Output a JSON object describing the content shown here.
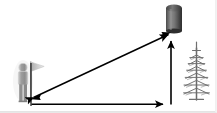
{
  "figure": {
    "title": "Surveying sight-line diagram",
    "background_color": "#ffffff",
    "width": 217,
    "height": 113
  },
  "palette": {
    "line_color": "#000000",
    "person_fill": "#9a9a9a",
    "person_outline": "#cfcfcf",
    "flag_fill": "#c9c9c9",
    "pole_color": "#b4b4b4",
    "cylinder_dark": "#3a3a3a",
    "cylinder_mid": "#6e6e6e",
    "cylinder_light": "#8c8c8c",
    "tree_color": "#6b6b6b",
    "border_color": "#e8e8e8"
  },
  "objects": {
    "observer": {
      "name": "person",
      "label": "",
      "x": 17,
      "y": 62,
      "width": 14,
      "height": 40
    },
    "flag": {
      "name": "flag-on-pole",
      "label": "",
      "pole_x": 30,
      "pole_top_y": 61,
      "pole_bottom_y": 102,
      "pennant_direction": "right"
    },
    "tower": {
      "name": "cylindrical-tower",
      "label": "",
      "x": 166,
      "y": 4,
      "width": 16,
      "height": 27,
      "shape": "cylinder"
    },
    "tree": {
      "name": "fir-tree",
      "label": "",
      "x": 185,
      "y": 42,
      "width": 28,
      "height": 58,
      "shape": "conifer"
    }
  },
  "measurements": {
    "slant": {
      "name": "line-of-sight",
      "label": "",
      "arrow_style": "double-headed",
      "from": [
        31,
        98
      ],
      "to": [
        171,
        33
      ]
    },
    "ground": {
      "name": "ground-distance",
      "label": "",
      "arrow_style": "single-headed-right",
      "from": [
        31,
        104
      ],
      "to": [
        171,
        104
      ]
    },
    "height": {
      "name": "tower-height",
      "label": "",
      "arrow_style": "single-headed-up",
      "from": [
        171,
        104
      ],
      "to": [
        171,
        33
      ]
    },
    "baseline": {
      "name": "vertical-baseline",
      "label": "",
      "from": [
        31,
        63
      ],
      "to": [
        31,
        106
      ]
    }
  },
  "icon_names": {
    "person": "person-icon",
    "flag": "flag-icon",
    "tower": "cylinder-tower-icon",
    "tree": "fir-tree-icon",
    "slant_arrow": "double-arrow-icon",
    "ground_arrow": "right-arrow-icon",
    "height_arrow": "up-arrow-icon"
  }
}
